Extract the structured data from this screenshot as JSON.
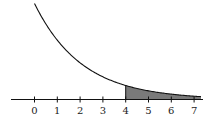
{
  "chart_data": {
    "type": "area",
    "title": "",
    "xlabel": "",
    "ylabel": "",
    "x_ticks": [
      "0",
      "1",
      "2",
      "3",
      "4",
      "5",
      "6",
      "7"
    ],
    "xlim": [
      -1,
      7.3
    ],
    "shaded_region": {
      "from": 4,
      "to": 7.3
    },
    "curve": {
      "kind": "exponential-decay",
      "start_x": 0
    },
    "colors": {
      "curve": "#111111",
      "shade": "#7a7a7a",
      "axis": "#111111"
    }
  },
  "axis": {
    "ticks": [
      "0",
      "1",
      "2",
      "3",
      "4",
      "5",
      "6",
      "7"
    ]
  }
}
